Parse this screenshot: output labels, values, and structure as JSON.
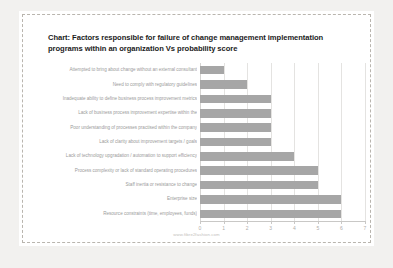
{
  "chart_data": {
    "type": "bar",
    "orientation": "horizontal",
    "title": "Chart: Factors responsible for failure of change management implementation programs within an organization Vs probability score",
    "title_lines": [
      "Chart: Factors responsible for failure of change management implementation",
      "programs within an organization Vs probability score"
    ],
    "xlabel": "",
    "ylabel": "",
    "xlim": [
      0,
      7
    ],
    "xticks": [
      "0",
      "1",
      "2",
      "3",
      "4",
      "5",
      "6",
      "7"
    ],
    "grid": true,
    "legend": false,
    "bar_color": "#a6a6a6",
    "categories": [
      "Attempted to bring about change without an external consultant",
      "Need to comply with regulatory guidelines",
      "Inadequate ability to define business process improvement metrics",
      "Lack of business process improvement expertise within the",
      "Poor understanding of processes practised within the company",
      "Lack of clarity about improvement targets / goals",
      "Lack of technology upgradation / automation to support efficiency",
      "Process complexity or lack of standard operating procedures",
      "Staff inertia or resistance to change",
      "Enterprise size",
      "Resource constraints (time, employees, funds)"
    ],
    "values": [
      1,
      2,
      3,
      3,
      3,
      3,
      4,
      5,
      5,
      6,
      6
    ]
  },
  "footer": {
    "watermark": "www.fibre2fashion.com"
  }
}
